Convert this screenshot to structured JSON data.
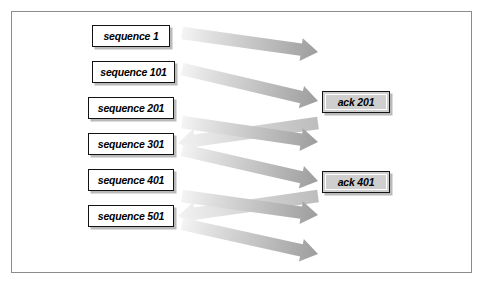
{
  "figure": {
    "frame": {
      "border_color": "#8c8c8c",
      "background": "#ffffff"
    }
  },
  "colors": {
    "box_border": "#131313",
    "seq_box_fill": "#ffffff",
    "ack_box_fill": "#cfcfcf",
    "box_shadow": "#828282",
    "arrow_light": "#efefef",
    "arrow_mid": "#c9c9c9",
    "arrow_dark": "#9a9a9a",
    "text": "#000000"
  },
  "sequence_boxes": [
    {
      "id": "sequence-1",
      "label": "sequence 1",
      "x": 92,
      "y": 25,
      "width": 78
    },
    {
      "id": "sequence-101",
      "label": "sequence 101",
      "x": 92,
      "y": 61,
      "width": 83
    },
    {
      "id": "sequence-201",
      "label": "sequence 201",
      "x": 88,
      "y": 97,
      "width": 86
    },
    {
      "id": "sequence-301",
      "label": "sequence 301",
      "x": 88,
      "y": 133,
      "width": 86
    },
    {
      "id": "sequence-401",
      "label": "sequence 401",
      "x": 88,
      "y": 169,
      "width": 86
    },
    {
      "id": "sequence-501",
      "label": "sequence 501",
      "x": 88,
      "y": 205,
      "width": 86
    }
  ],
  "ack_boxes": [
    {
      "id": "ack-201",
      "label": "ack 201",
      "x": 322,
      "y": 91,
      "width": 68
    },
    {
      "id": "ack-401",
      "label": "ack 401",
      "x": 322,
      "y": 171,
      "width": 68
    }
  ],
  "arrows": [
    {
      "id": "arrow-seq-1",
      "direction": "right",
      "from": "sequence 1",
      "x1": 182,
      "y1": 33,
      "x2": 318,
      "y2": 52
    },
    {
      "id": "arrow-seq-101",
      "direction": "right",
      "from": "sequence 101",
      "x1": 182,
      "y1": 69,
      "x2": 318,
      "y2": 101
    },
    {
      "id": "arrow-ack-201",
      "direction": "left",
      "from": "ack 201",
      "x1": 318,
      "y1": 123,
      "x2": 178,
      "y2": 143
    },
    {
      "id": "arrow-seq-201",
      "direction": "right",
      "from": "sequence 201",
      "x1": 182,
      "y1": 122,
      "x2": 318,
      "y2": 142
    },
    {
      "id": "arrow-seq-301",
      "direction": "right",
      "from": "sequence 301",
      "x1": 182,
      "y1": 150,
      "x2": 318,
      "y2": 181
    },
    {
      "id": "arrow-ack-401",
      "direction": "left",
      "from": "ack 401",
      "x1": 318,
      "y1": 196,
      "x2": 178,
      "y2": 216
    },
    {
      "id": "arrow-seq-401",
      "direction": "right",
      "from": "sequence 401",
      "x1": 182,
      "y1": 196,
      "x2": 318,
      "y2": 215
    },
    {
      "id": "arrow-seq-501",
      "direction": "right",
      "from": "sequence 501",
      "x1": 182,
      "y1": 224,
      "x2": 318,
      "y2": 254
    }
  ]
}
